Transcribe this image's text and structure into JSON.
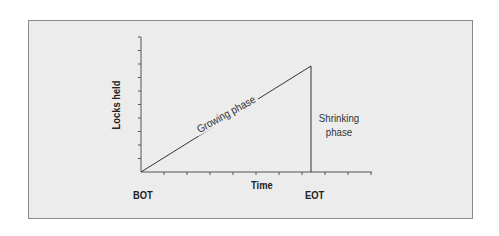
{
  "diagram": {
    "title": "",
    "y_axis_label": "Locks held",
    "x_axis_label": "Time",
    "start_label": "BOT",
    "end_label": "EOT",
    "growing_label": "Growing phase",
    "shrinking_label_line1": "Shrinking",
    "shrinking_label_line2": "phase",
    "colors": {
      "frame_background": "#ececec",
      "frame_border": "#8a8a8a",
      "line": "#333333",
      "text": "#222222"
    },
    "y_ticks": 10,
    "x_ticks": 10
  }
}
